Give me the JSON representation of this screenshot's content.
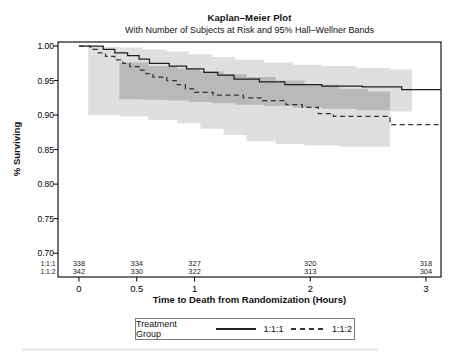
{
  "header": {
    "title": "Kaplan–Meier Plot",
    "subtitle": "With Number of Subjects at Risk and 95% Hall–Wellner Bands"
  },
  "axes": {
    "xlabel": "Time to Death from Randomization (Hours)",
    "ylabel": "% Surviving"
  },
  "legend": {
    "label": "Treatment Group",
    "entries": [
      {
        "name": "1:1:1",
        "style": "solid"
      },
      {
        "name": "1:1:2",
        "style": "dashed"
      }
    ]
  },
  "colors": {
    "band_single": "#dfdfdf",
    "band_overlap": "#b9b9b9",
    "line_solid": "#1f1f1f",
    "line_dashed": "#333333",
    "frame": "#000000",
    "text": "#222222"
  },
  "chart_data": {
    "type": "line",
    "subtype": "kaplan-meier-step",
    "title": "Kaplan–Meier Plot",
    "subtitle": "With Number of Subjects at Risk and 95% Hall–Wellner Bands",
    "xlabel": "Time to Death from Randomization (Hours)",
    "ylabel": "% Surviving",
    "grid": false,
    "legend_position": "bottom",
    "xlim": [
      -0.181,
      3.13
    ],
    "ylim": [
      0.6655,
      1.0058
    ],
    "xticks": {
      "values": [
        0,
        0.5,
        1,
        2,
        3
      ],
      "labels": [
        "0",
        "0.5",
        "1",
        "2",
        "3"
      ]
    },
    "yticks": {
      "values": [
        1.0,
        0.95,
        0.9,
        0.85,
        0.8,
        0.75,
        0.7
      ],
      "labels": [
        "1.00",
        "0.95",
        "0.90",
        "0.85",
        "0.80",
        "0.75",
        "0.70"
      ]
    },
    "series": [
      {
        "name": "1:1:1",
        "style": "solid",
        "points": [
          [
            0,
            1.0
          ],
          [
            0.21,
            0.995
          ],
          [
            0.31,
            0.99
          ],
          [
            0.42,
            0.986
          ],
          [
            0.52,
            0.981
          ],
          [
            0.61,
            0.975
          ],
          [
            0.78,
            0.971
          ],
          [
            0.93,
            0.967
          ],
          [
            1.08,
            0.962
          ],
          [
            1.2,
            0.958
          ],
          [
            1.34,
            0.952
          ],
          [
            1.56,
            0.948
          ],
          [
            1.78,
            0.944
          ],
          [
            2.1,
            0.942
          ],
          [
            2.45,
            0.941
          ],
          [
            2.79,
            0.937
          ],
          [
            3.13,
            0.937
          ]
        ]
      },
      {
        "name": "1:1:2",
        "style": "dashed",
        "points": [
          [
            0,
            1.0
          ],
          [
            0.1,
            0.995
          ],
          [
            0.16,
            0.99
          ],
          [
            0.23,
            0.985
          ],
          [
            0.31,
            0.98
          ],
          [
            0.38,
            0.975
          ],
          [
            0.44,
            0.97
          ],
          [
            0.52,
            0.965
          ],
          [
            0.58,
            0.96
          ],
          [
            0.64,
            0.955
          ],
          [
            0.76,
            0.95
          ],
          [
            0.85,
            0.944
          ],
          [
            0.92,
            0.938
          ],
          [
            0.99,
            0.933
          ],
          [
            1.16,
            0.929
          ],
          [
            1.42,
            0.925
          ],
          [
            1.59,
            0.921
          ],
          [
            1.79,
            0.915
          ],
          [
            1.93,
            0.911
          ],
          [
            2.07,
            0.902
          ],
          [
            2.2,
            0.898
          ],
          [
            2.69,
            0.886
          ],
          [
            3.13,
            0.886
          ]
        ]
      }
    ],
    "bands": [
      {
        "name": "1:1:1",
        "points": [
          [
            0.35,
            0.923,
            0.998
          ],
          [
            0.55,
            0.922,
            0.995
          ],
          [
            0.76,
            0.921,
            0.992
          ],
          [
            0.95,
            0.919,
            0.988
          ],
          [
            1.15,
            0.917,
            0.984
          ],
          [
            1.35,
            0.915,
            0.98
          ],
          [
            1.6,
            0.913,
            0.976
          ],
          [
            1.85,
            0.911,
            0.973
          ],
          [
            2.1,
            0.909,
            0.971
          ],
          [
            2.4,
            0.907,
            0.968
          ],
          [
            2.69,
            0.905,
            0.966
          ],
          [
            2.88,
            0.904,
            0.965
          ]
        ]
      },
      {
        "name": "1:1:2",
        "points": [
          [
            0.08,
            0.9,
            0.999
          ],
          [
            0.35,
            0.898,
            0.976
          ],
          [
            0.6,
            0.893,
            0.971
          ],
          [
            0.85,
            0.888,
            0.967
          ],
          [
            1.05,
            0.88,
            0.963
          ],
          [
            1.25,
            0.871,
            0.959
          ],
          [
            1.45,
            0.862,
            0.955
          ],
          [
            1.7,
            0.858,
            0.95
          ],
          [
            1.95,
            0.856,
            0.944
          ],
          [
            2.25,
            0.854,
            0.938
          ],
          [
            2.5,
            0.854,
            0.934
          ],
          [
            2.69,
            0.856,
            0.931
          ]
        ]
      }
    ],
    "at_risk": {
      "times": [
        0,
        0.5,
        1,
        2,
        3
      ],
      "rows": [
        {
          "label": "1:1:1",
          "values": [
            "338",
            "334",
            "327",
            "320",
            "318"
          ]
        },
        {
          "label": "1:1:2",
          "values": [
            "342",
            "330",
            "322",
            "313",
            "304"
          ]
        }
      ]
    }
  }
}
